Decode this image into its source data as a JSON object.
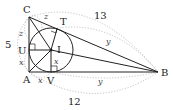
{
  "diagram": {
    "type": "geometry",
    "points": {
      "A": {
        "label": "A",
        "x": 29,
        "y": 72
      },
      "B": {
        "label": "B",
        "x": 158,
        "y": 72
      },
      "C": {
        "label": "C",
        "x": 29,
        "y": 17
      },
      "I": {
        "label": "I",
        "x": 51,
        "y": 50
      },
      "T": {
        "label": "T"
      },
      "U": {
        "label": "U"
      },
      "V": {
        "label": "V"
      }
    },
    "side_lengths": {
      "AC": "5",
      "CB": "13",
      "AB": "12"
    },
    "tangent_labels": {
      "x": "x",
      "y": "y",
      "z": "z"
    },
    "colors": {
      "line": "#222222",
      "dotted": "#999999"
    }
  }
}
